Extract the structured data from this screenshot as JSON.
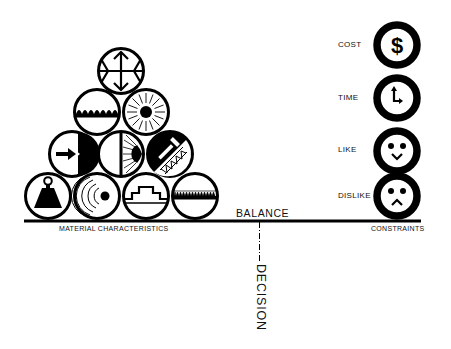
{
  "diagram": {
    "title_center": "BALANCE",
    "decision_label": "DECISION",
    "left_group": {
      "label": "MATERIAL   CHARACTERISTICS",
      "layout": "pyramid of 10 circular icons (4-3-2-1)",
      "rows": [
        {
          "row": 4,
          "icons": [
            "four-way-arrows-expansion-icon"
          ]
        },
        {
          "row": 3,
          "icons": [
            "wave-surface-icon",
            "radiating-sun-icon"
          ]
        },
        {
          "row": 2,
          "icons": [
            "arrow-into-solid-icon",
            "light-refraction-icon",
            "hammer-on-truss-icon"
          ]
        },
        {
          "row": 1,
          "icons": [
            "weight-icon",
            "sound-waves-icon",
            "stepped-profile-icon",
            "serrated-texture-icon"
          ]
        }
      ]
    },
    "right_group": {
      "label": "CONSTRAINTS",
      "items": [
        {
          "label": "COST",
          "icon": "dollar-icon"
        },
        {
          "label": "TIME",
          "icon": "clock-icon"
        },
        {
          "label": "LIKE",
          "icon": "happy-face-icon"
        },
        {
          "label": "DISLIKE",
          "icon": "sad-face-icon"
        }
      ]
    },
    "colors": {
      "ink": "#000000",
      "background": "#ffffff"
    }
  }
}
